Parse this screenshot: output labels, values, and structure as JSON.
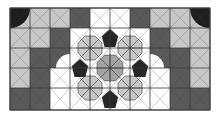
{
  "figure": {
    "frame": {
      "x": 10,
      "y": 8,
      "w": 200,
      "h": 102
    },
    "colors": {
      "white": "#ffffff",
      "light": "#c8c8c8",
      "mid": "#a4a4a4",
      "dark": "#5a5a5a",
      "black": "#262626",
      "line": "#3a3a3a",
      "speckle": "#1e1e1e"
    },
    "grid": {
      "cols": [
        10,
        30,
        50,
        70,
        90,
        110,
        130,
        150,
        170,
        190,
        210
      ],
      "rows": [
        8,
        28,
        48,
        68,
        88,
        110
      ]
    },
    "rosettes": [
      {
        "cx": 110,
        "cy": 68,
        "r": 14,
        "fill": "mid"
      },
      {
        "cx": 90,
        "cy": 48,
        "r": 13,
        "fill": "light"
      },
      {
        "cx": 130,
        "cy": 48,
        "r": 13,
        "fill": "light"
      },
      {
        "cx": 90,
        "cy": 88,
        "r": 13,
        "fill": "light"
      },
      {
        "cx": 130,
        "cy": 88,
        "r": 13,
        "fill": "light"
      }
    ],
    "kites": [
      {
        "cx": 110,
        "cy": 38,
        "fill": "black"
      },
      {
        "cx": 110,
        "cy": 99,
        "fill": "black"
      },
      {
        "cx": 80,
        "cy": 68,
        "fill": "black"
      },
      {
        "cx": 140,
        "cy": 68,
        "fill": "black"
      }
    ]
  }
}
